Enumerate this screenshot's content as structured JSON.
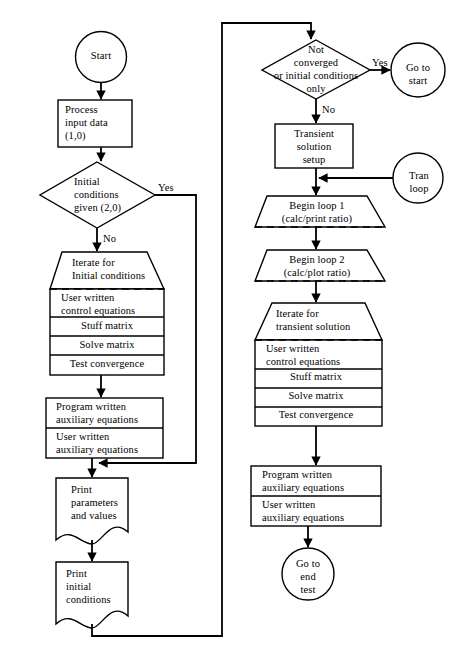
{
  "diagram": {
    "type": "flowchart",
    "colors": {
      "stroke": "#000000",
      "fill": "#ffffff",
      "text": "#000000"
    }
  },
  "left_column": {
    "start": {
      "label": "Start",
      "shape": "circle"
    },
    "process_input": {
      "line1": "Process",
      "line2": "input data",
      "line3": "(1,0)",
      "shape": "rectangle"
    },
    "decision_initial": {
      "line1": "Initial",
      "line2": "conditions",
      "line3": "given (2,0)",
      "shape": "diamond"
    },
    "decision_initial_yes": "Yes",
    "decision_initial_no": "No",
    "iterate_initial": {
      "line1": "Iterate for",
      "line2": "Initial conditions",
      "shape": "trapezoid-loop"
    },
    "stack_initial": [
      {
        "line1": "User written",
        "line2": "control equations"
      },
      {
        "line1": "Stuff matrix",
        "line2": ""
      },
      {
        "line1": "Solve matrix",
        "line2": ""
      },
      {
        "line1": "Test convergence",
        "line2": ""
      }
    ],
    "aux_initial": [
      {
        "line1": "Program written",
        "line2": "auxiliary equations"
      },
      {
        "line1": "User written",
        "line2": "auxiliary equations"
      }
    ],
    "print_parameters": {
      "line1": "Print",
      "line2": "parameters",
      "line3": "and values",
      "shape": "document"
    },
    "print_initial": {
      "line1": "Print",
      "line2": "initial",
      "line3": "conditions",
      "shape": "document"
    }
  },
  "right_column": {
    "decision_converged": {
      "line1": "Not",
      "line2": "converged",
      "line3": "or initial conditions",
      "line4": "only",
      "shape": "diamond"
    },
    "decision_converged_yes": "Yes",
    "decision_converged_no": "No",
    "go_to_start": {
      "line1": "Go to",
      "line2": "start",
      "shape": "circle"
    },
    "transient_setup": {
      "line1": "Transient",
      "line2": "solution",
      "line3": "setup",
      "shape": "rectangle"
    },
    "tran_loop": {
      "line1": "Tran",
      "line2": "loop",
      "shape": "circle"
    },
    "begin_loop_1": {
      "line1": "Begin loop 1",
      "line2": "(calc/print ratio)",
      "shape": "trapezoid-loop"
    },
    "begin_loop_2": {
      "line1": "Begin loop 2",
      "line2": "(calc/plot ratio)",
      "shape": "trapezoid-loop"
    },
    "iterate_transient": {
      "line1": "Iterate for",
      "line2": "transient solution",
      "shape": "trapezoid-loop"
    },
    "stack_transient": [
      {
        "line1": "User written",
        "line2": "control equations"
      },
      {
        "line1": "Stuff matrix",
        "line2": ""
      },
      {
        "line1": "Solve matrix",
        "line2": ""
      },
      {
        "line1": "Test convergence",
        "line2": ""
      }
    ],
    "aux_transient": [
      {
        "line1": "Program written",
        "line2": "auxiliary equations"
      },
      {
        "line1": "User written",
        "line2": "auxiliary equations"
      }
    ],
    "go_to_end_test": {
      "line1": "Go to",
      "line2": "end",
      "line3": "test",
      "shape": "circle"
    }
  }
}
